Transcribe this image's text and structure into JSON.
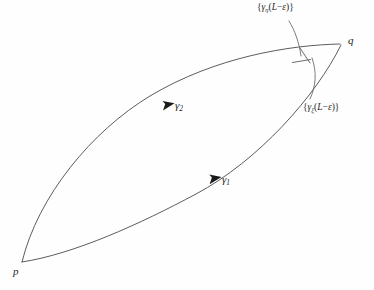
{
  "figure": {
    "background_color": "#fefefe",
    "stroke_color": "#4a4a4a",
    "label_color": "#262626",
    "points": {
      "start_label": "p",
      "end_label": "q"
    },
    "curves": {
      "lower_label_base": "γ",
      "lower_label_sub": "1",
      "upper_label_base": "γ",
      "upper_label_sub": "2"
    },
    "annotations": {
      "eta": {
        "open_brace": "{",
        "gamma": "γ",
        "subscript": "η",
        "open_paren": "(",
        "arg_L": "L",
        "minus": "−",
        "arg_eps": "ε",
        "close_paren": ")",
        "close_brace": "}"
      },
      "xi": {
        "open_brace": "{",
        "gamma": "γ",
        "subscript": "ξ",
        "open_paren": "(",
        "arg_L": "L",
        "minus": "−",
        "arg_eps": "ε",
        "close_paren": ")",
        "close_brace": "}"
      }
    }
  }
}
